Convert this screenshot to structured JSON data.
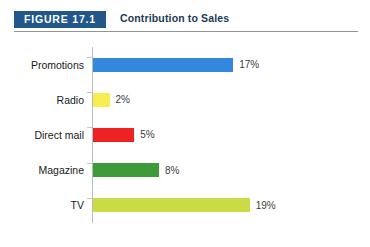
{
  "figure": {
    "tag": "FIGURE 17.1",
    "title": "Contribution to Sales",
    "tag_bg_color": "#22578a",
    "tag_text_color": "#ffffff",
    "title_color": "#1b3a57",
    "rule_color": "#8e9499"
  },
  "chart_data": {
    "type": "bar",
    "orientation": "horizontal",
    "title": "Contribution to Sales",
    "xlabel": "",
    "ylabel": "",
    "categories": [
      "Promotions",
      "Radio",
      "Direct mail",
      "Magazine",
      "TV"
    ],
    "values": [
      17,
      2,
      5,
      8,
      19
    ],
    "value_labels": [
      "17%",
      "2%",
      "5%",
      "8%",
      "19%"
    ],
    "unit": "%",
    "xlim": [
      0,
      20
    ],
    "grid": false,
    "legend": false,
    "bar_colors": [
      "#3387dd",
      "#f7ed4e",
      "#ee2222",
      "#3e9b3a",
      "#cbdb45"
    ],
    "series": [
      {
        "name": "Contribution to Sales",
        "values": [
          17,
          2,
          5,
          8,
          19
        ]
      }
    ]
  }
}
